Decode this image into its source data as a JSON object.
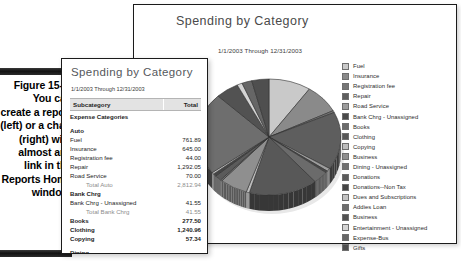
{
  "caption": {
    "figure_label": "Figure 15-2:",
    "body": "You can create a report (left) or a chart (right) with almost any link in the Reports Home window."
  },
  "chart_window": {
    "title": "Spending by Category",
    "subtitle": "1/1/2003 Through 12/31/2003",
    "legend": [
      {
        "label": "Fuel",
        "color": "#c9c9c9"
      },
      {
        "label": "Insurance",
        "color": "#8a8a8a"
      },
      {
        "label": "Registration fee",
        "color": "#767676"
      },
      {
        "label": "Repair",
        "color": "#5e5e5e"
      },
      {
        "label": "Road Service",
        "color": "#9d9d9d"
      },
      {
        "label": "Bank Chrg - Unassigned",
        "color": "#4a4a4a"
      },
      {
        "label": "Books",
        "color": "#6b6b6b"
      },
      {
        "label": "Clothing",
        "color": "#585858"
      },
      {
        "label": "Copying",
        "color": "#bdbdbd"
      },
      {
        "label": "Business",
        "color": "#8f8f8f"
      },
      {
        "label": "Dining - Unassigned",
        "color": "#707070"
      },
      {
        "label": "Donations",
        "color": "#5b5b5b"
      },
      {
        "label": "Donations--Non Tax",
        "color": "#454545"
      },
      {
        "label": "Dues and Subscriptions",
        "color": "#c4c4c4"
      },
      {
        "label": "Addies Loan",
        "color": "#6e6e6e"
      },
      {
        "label": "Business",
        "color": "#525252"
      },
      {
        "label": "Entertainment - Unassigned",
        "color": "#d4d4d4"
      },
      {
        "label": "Expense-Bus",
        "color": "#666666"
      },
      {
        "label": "Gifts",
        "color": "#4f4f4f"
      }
    ]
  },
  "chart_data": {
    "type": "pie",
    "title": "Spending by Category",
    "subtitle": "1/1/2003 Through 12/31/2003",
    "legend_position": "right",
    "labels": [
      "Fuel",
      "Insurance",
      "Registration fee",
      "Repair",
      "Road Service",
      "Bank Chrg - Unassigned",
      "Books",
      "Clothing",
      "Copying",
      "Business",
      "Dining - Unassigned",
      "Donations",
      "Donations--Non Tax",
      "Dues and Subscriptions",
      "Addies Loan",
      "Business",
      "Entertainment - Unassigned",
      "Expense-Bus",
      "Gifts"
    ],
    "values": [
      761.89,
      645.0,
      44.0,
      1292.05,
      70.0,
      41.55,
      277.5,
      1240.96,
      57.34,
      501.05,
      32.21,
      120.0,
      60.0,
      38.0,
      1850.0,
      420.0,
      95.0,
      180.0,
      310.0
    ],
    "colors": [
      "#c9c9c9",
      "#8a8a8a",
      "#767676",
      "#5e5e5e",
      "#9d9d9d",
      "#4a4a4a",
      "#6b6b6b",
      "#585858",
      "#bdbdbd",
      "#8f8f8f",
      "#707070",
      "#5b5b5b",
      "#454545",
      "#c4c4c4",
      "#6e6e6e",
      "#525252",
      "#d4d4d4",
      "#666666",
      "#4f4f4f"
    ]
  },
  "report_window": {
    "title": "Spending by Category",
    "subtitle": "1/1/2003 Through 12/31/2003",
    "columns": {
      "subcategory": "Subcategory",
      "total": "Total"
    },
    "rows": [
      {
        "label": "Expense Categories",
        "value": "",
        "style": "bold"
      },
      {
        "label": "Auto",
        "value": "",
        "style": "bold"
      },
      {
        "label": "Fuel",
        "value": "761.89",
        "style": "normal"
      },
      {
        "label": "Insurance",
        "value": "645.00",
        "style": "normal"
      },
      {
        "label": "Registration fee",
        "value": "44.00",
        "style": "normal"
      },
      {
        "label": "Repair",
        "value": "1,292.05",
        "style": "normal"
      },
      {
        "label": "Road Service",
        "value": "70.00",
        "style": "normal"
      },
      {
        "label": "Total Auto",
        "value": "2,812.94",
        "style": "total"
      },
      {
        "label": "Bank Chrg",
        "value": "",
        "style": "bold"
      },
      {
        "label": "Bank Chrg - Unassigned",
        "value": "41.55",
        "style": "normal"
      },
      {
        "label": "Total Bank Chrg",
        "value": "41.55",
        "style": "total"
      },
      {
        "label": "Books",
        "value": "277.50",
        "style": "bold"
      },
      {
        "label": "Clothing",
        "value": "1,240.96",
        "style": "bold"
      },
      {
        "label": "Copying",
        "value": "57.34",
        "style": "bold"
      },
      {
        "label": "Dining",
        "value": "",
        "style": "bold"
      },
      {
        "label": "Business",
        "value": "501.05",
        "style": "normal"
      },
      {
        "label": "Dining - Unassigned",
        "value": "32.21",
        "style": "normal"
      },
      {
        "label": "Total Dining",
        "value": "533.26",
        "style": "total"
      }
    ]
  }
}
